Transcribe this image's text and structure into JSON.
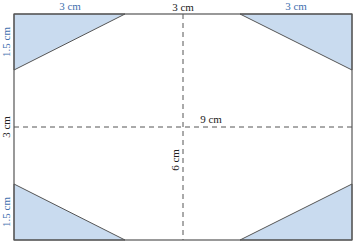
{
  "colors": {
    "triangle_fill": "#c9dbef",
    "outline": "#555555",
    "dashed": "#555555",
    "blue_label": "#3f6fae",
    "black_label": "#222222"
  },
  "labels": {
    "top_left_width": "3 cm",
    "top_center_width": "3 cm",
    "top_right_width": "3 cm",
    "left_top_height": "1.5 cm",
    "left_middle_height": "3 cm",
    "left_bottom_height": "1.5 cm",
    "horizontal_dashed": "9 cm",
    "vertical_dashed": "6 cm"
  }
}
